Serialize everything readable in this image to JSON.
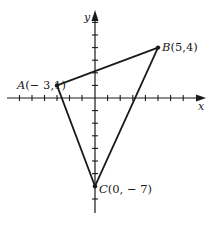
{
  "figure": {
    "axes": {
      "x_label": "x",
      "y_label": "y",
      "x_ticks": [
        -7,
        -6,
        -5,
        -4,
        -3,
        -2,
        -1,
        1,
        2,
        3,
        4,
        5,
        6,
        7
      ],
      "y_ticks": [
        6,
        5,
        4,
        3,
        2,
        1,
        -1,
        -2,
        -3,
        -4,
        -5,
        -6,
        -7,
        -8
      ]
    },
    "points": [
      {
        "name": "A",
        "coords": "(− 3,1)",
        "x": -3,
        "y": 1
      },
      {
        "name": "B",
        "coords": "(5,4)",
        "x": 5,
        "y": 4
      },
      {
        "name": "C",
        "coords": "(0, − 7)",
        "x": 0,
        "y": -7
      }
    ],
    "shape": "triangle ABC",
    "color": "#1a1a1a"
  }
}
